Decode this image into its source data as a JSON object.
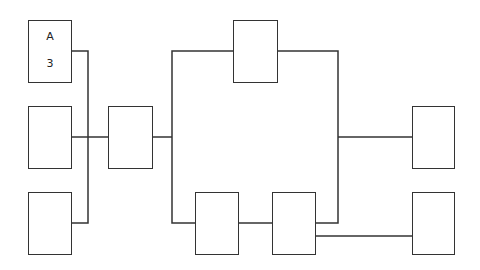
{
  "diagram": {
    "stroke_color": "#333333",
    "background": "#ffffff",
    "nodes": [
      {
        "id": "n1",
        "label_top": "A",
        "label_bottom": "3"
      },
      {
        "id": "n2"
      },
      {
        "id": "n3"
      },
      {
        "id": "n4"
      },
      {
        "id": "n5"
      },
      {
        "id": "n6"
      },
      {
        "id": "n7"
      },
      {
        "id": "n8"
      },
      {
        "id": "n9"
      }
    ]
  }
}
